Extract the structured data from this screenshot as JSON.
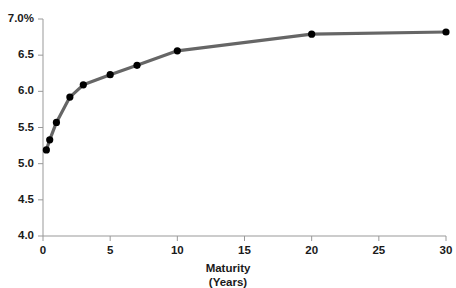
{
  "chart_data": {
    "type": "line",
    "title": "",
    "subtitle": "",
    "xlabel": "Maturity",
    "xlabel_sub": "(Years)",
    "ylabel": "",
    "xlim": [
      0,
      30
    ],
    "ylim": [
      4.0,
      7.0
    ],
    "grid": false,
    "legend": "none",
    "x_ticks": [
      0,
      5,
      10,
      15,
      20,
      25,
      30
    ],
    "x_tick_labels": [
      "0",
      "5",
      "10",
      "15",
      "20",
      "25",
      "30"
    ],
    "y_ticks": [
      4.0,
      4.5,
      5.0,
      5.5,
      6.0,
      6.5,
      7.0
    ],
    "y_tick_labels": [
      "4.0",
      "4.5",
      "5.0",
      "5.5",
      "6.0",
      "6.5",
      "7.0%"
    ],
    "series": [
      {
        "name": "Yield Curve",
        "line_color": "#666666",
        "marker_color": "#000000",
        "marker": "circle",
        "x": [
          0.25,
          0.5,
          1,
          2,
          3,
          5,
          7,
          10,
          20,
          30
        ],
        "y": [
          5.19,
          5.33,
          5.57,
          5.92,
          6.09,
          6.23,
          6.36,
          6.56,
          6.79,
          6.82
        ]
      }
    ],
    "annotations": []
  },
  "colors": {
    "line": "#666666",
    "marker": "#000000",
    "axis": "#999999",
    "text": "#1a1a1a",
    "background": "#ffffff"
  }
}
